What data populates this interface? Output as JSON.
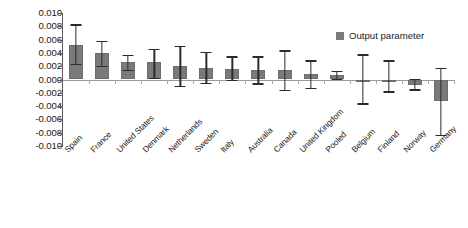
{
  "chart_data": {
    "type": "bar",
    "title": "",
    "subtitle": "",
    "xlabel": "",
    "ylabel": "",
    "orientation": "vertical",
    "grid": false,
    "legend_position": "top-right",
    "ylim": [
      -0.01,
      0.01
    ],
    "ytick_labels": [
      "0.010",
      "0.008",
      "0.006",
      "0.004",
      "0.002",
      "0.000",
      "-0.002",
      "-0.004",
      "-0.006",
      "-0.008",
      "-0.010"
    ],
    "ytick_values": [
      0.01,
      0.008,
      0.006,
      0.004,
      0.002,
      0.0,
      -0.002,
      -0.004,
      -0.006,
      -0.008,
      -0.01
    ],
    "bar_color": "#7a7a7a",
    "errorbar_color": "#2b2b2b",
    "categories": [
      "Spain",
      "France",
      "United States",
      "Denmark",
      "Netherlands",
      "Sweden",
      "Italy",
      "Australia",
      "Canada",
      "United Kingdom",
      "Pooled",
      "Belgium",
      "Finland",
      "Norway",
      "Germany"
    ],
    "series": [
      {
        "name": "Output parameter",
        "values": [
          0.0052,
          0.004,
          0.0026,
          0.0026,
          0.0021,
          0.0018,
          0.0016,
          0.0015,
          0.0014,
          0.0008,
          0.0007,
          0.0,
          -0.0001,
          -0.0009,
          -0.0033
        ],
        "error_low": [
          0.0024,
          0.0021,
          0.0015,
          0.0002,
          -0.001,
          -0.0005,
          -0.0001,
          -0.0006,
          -0.0016,
          -0.0013,
          0.0001,
          -0.0036,
          -0.0018,
          -0.0015,
          -0.0083
        ],
        "error_high": [
          0.0083,
          0.0058,
          0.0037,
          0.0046,
          0.0051,
          0.0042,
          0.0035,
          0.0035,
          0.0044,
          0.0029,
          0.0013,
          0.0038,
          0.0029,
          0.0001,
          0.0017
        ]
      }
    ]
  },
  "legend": {
    "entries": [
      {
        "label": "Output parameter",
        "color": "#7a7a7a"
      }
    ]
  }
}
